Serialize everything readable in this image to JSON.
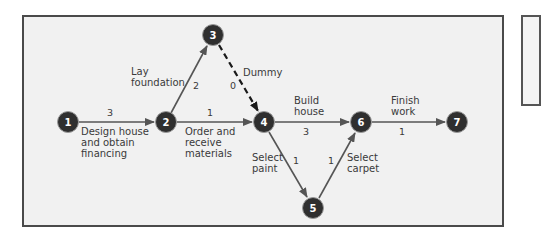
{
  "diagram": {
    "type": "activity-on-arrow network",
    "colors": {
      "node_fill": "#2f2f2f",
      "node_ring": "#9a9a9a",
      "arrow": "#555555",
      "frame_bg": "#f1f1f1",
      "frame_border": "#4a4a4a",
      "text": "#3a3a3a"
    },
    "nodes": [
      {
        "id": "1",
        "label": "1"
      },
      {
        "id": "2",
        "label": "2"
      },
      {
        "id": "3",
        "label": "3"
      },
      {
        "id": "4",
        "label": "4"
      },
      {
        "id": "5",
        "label": "5"
      },
      {
        "id": "6",
        "label": "6"
      },
      {
        "id": "7",
        "label": "7"
      }
    ],
    "activities": [
      {
        "from": "1",
        "to": "2",
        "name_lines": [
          "Design house",
          "and obtain",
          "financing"
        ],
        "duration": "3",
        "dummy": false
      },
      {
        "from": "2",
        "to": "3",
        "name_lines": [
          "Lay",
          "foundation"
        ],
        "duration": "2",
        "dummy": false
      },
      {
        "from": "2",
        "to": "4",
        "name_lines": [
          "Order and",
          "receive",
          "materials"
        ],
        "duration": "1",
        "dummy": false
      },
      {
        "from": "3",
        "to": "4",
        "name_lines": [
          "Dummy"
        ],
        "duration": "0",
        "dummy": true
      },
      {
        "from": "4",
        "to": "6",
        "name_lines": [
          "Build",
          "house"
        ],
        "duration": "3",
        "dummy": false
      },
      {
        "from": "4",
        "to": "5",
        "name_lines": [
          "Select",
          "paint"
        ],
        "duration": "1",
        "dummy": false
      },
      {
        "from": "5",
        "to": "6",
        "name_lines": [
          "Select",
          "carpet"
        ],
        "duration": "1",
        "dummy": false
      },
      {
        "from": "6",
        "to": "7",
        "name_lines": [
          "Finish",
          "work"
        ],
        "duration": "1",
        "dummy": false
      }
    ]
  }
}
